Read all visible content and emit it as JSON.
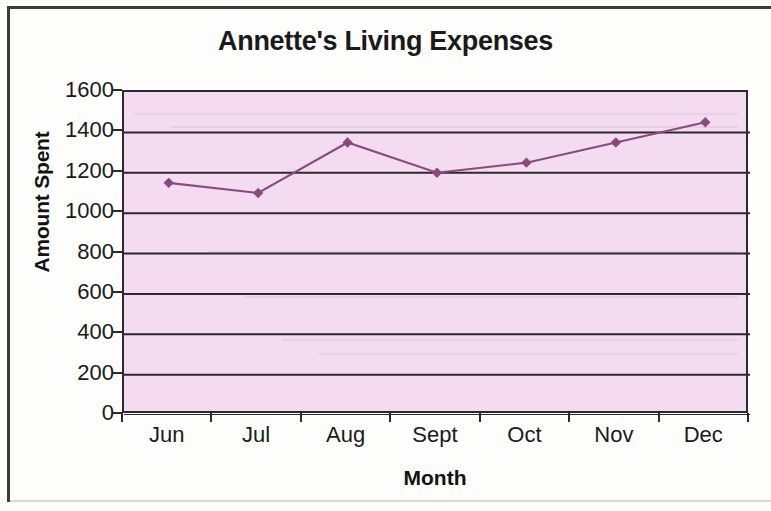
{
  "chart_data": {
    "type": "line",
    "title": "Annette's Living Expenses",
    "xlabel": "Month",
    "ylabel": "Amount Spent",
    "categories": [
      "Jun",
      "Jul",
      "Aug",
      "Sept",
      "Oct",
      "Nov",
      "Dec"
    ],
    "values": [
      1150,
      1100,
      1350,
      1200,
      1250,
      1350,
      1450
    ],
    "series": [
      {
        "name": "Amount Spent",
        "values": [
          1150,
          1100,
          1350,
          1200,
          1250,
          1350,
          1450
        ]
      }
    ],
    "ylim": [
      0,
      1600
    ],
    "ytick_labels": [
      "1600",
      "1400",
      "1200",
      "1000",
      "800",
      "600",
      "400",
      "200",
      "0"
    ],
    "ytick_values": [
      1600,
      1400,
      1200,
      1000,
      800,
      600,
      400,
      200,
      0
    ],
    "ystep": 200,
    "grid": true,
    "grid_axis": "y",
    "legend": "none",
    "marker": "diamond",
    "colors": {
      "series_line": "#8a4a7d",
      "marker": "#8a4a7d",
      "plot_background": "#f3dcef",
      "gridline": "#2b2b2b",
      "axis": "#2b2b2b",
      "text": "#1a1a1a"
    }
  }
}
